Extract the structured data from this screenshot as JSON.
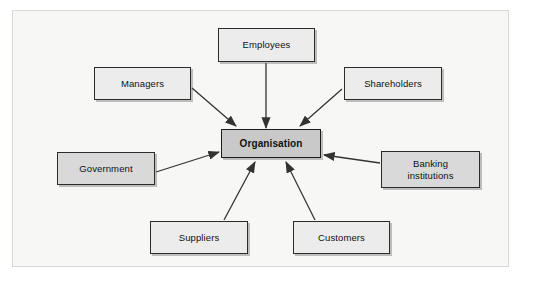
{
  "diagram": {
    "frame": {
      "background_color": "#f7f7f5",
      "border_color": "#d8d8d4"
    },
    "center": {
      "id": "organisation",
      "label": "Organisation",
      "fill_color": "#c9c9c9",
      "border_color": "#1c1c1c",
      "bold": true
    },
    "nodes": [
      {
        "id": "employees",
        "label": "Employees",
        "fill_color": "#ececec",
        "border_color": "#2b2b2b"
      },
      {
        "id": "managers",
        "label": "Managers",
        "fill_color": "#ececec",
        "border_color": "#2b2b2b"
      },
      {
        "id": "shareholders",
        "label": "Shareholders",
        "fill_color": "#ececec",
        "border_color": "#2b2b2b"
      },
      {
        "id": "government",
        "label": "Government",
        "fill_color": "#d9d9d9",
        "border_color": "#2b2b2b"
      },
      {
        "id": "banking-institutions",
        "label": "Banking\ninstitutions",
        "fill_color": "#d9d9d9",
        "border_color": "#2b2b2b"
      },
      {
        "id": "suppliers",
        "label": "Suppliers",
        "fill_color": "#ececec",
        "border_color": "#2b2b2b"
      },
      {
        "id": "customers",
        "label": "Customers",
        "fill_color": "#ececec",
        "border_color": "#2b2b2b"
      }
    ],
    "edges": [
      {
        "id": "employees-to-organisation",
        "from": "employees",
        "to": "organisation",
        "arrow": "to"
      },
      {
        "id": "managers-to-organisation",
        "from": "managers",
        "to": "organisation",
        "arrow": "to"
      },
      {
        "id": "shareholders-to-organisation",
        "from": "shareholders",
        "to": "organisation",
        "arrow": "to"
      },
      {
        "id": "government-to-organisation",
        "from": "government",
        "to": "organisation",
        "arrow": "to"
      },
      {
        "id": "banking-to-organisation",
        "from": "banking-institutions",
        "to": "organisation",
        "arrow": "to"
      },
      {
        "id": "suppliers-to-organisation",
        "from": "suppliers",
        "to": "organisation",
        "arrow": "to"
      },
      {
        "id": "customers-to-organisation",
        "from": "customers",
        "to": "organisation",
        "arrow": "to"
      }
    ],
    "edge_color": "#333333"
  }
}
